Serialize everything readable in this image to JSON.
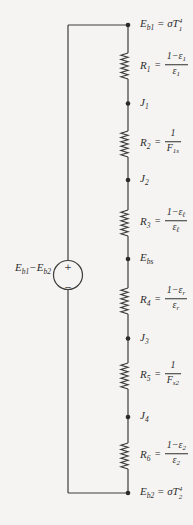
{
  "diagram": {
    "kind": "series radiation resistance network with shield",
    "colors": {
      "background": "#f5f4f2",
      "ink": "#3c3c3c",
      "text": "#2e2e2e"
    }
  },
  "source": {
    "plus": "+",
    "minus": "−",
    "label": {
      "m1": "E",
      "s1": "b1",
      "m2": "−E",
      "s2": "b2"
    }
  },
  "nodes": [
    {
      "id": "eb1",
      "main": "E",
      "sub": "b1",
      "eq": " = σT",
      "sup": "4",
      "sub2": "1"
    },
    {
      "id": "j1",
      "main": "J",
      "sub": "1"
    },
    {
      "id": "j2",
      "main": "J",
      "sub": "2"
    },
    {
      "id": "ebs",
      "main": "E",
      "sub": "bs"
    },
    {
      "id": "j3",
      "main": "J",
      "sub": "3"
    },
    {
      "id": "j4",
      "main": "J",
      "sub": "4"
    },
    {
      "id": "eb2",
      "main": "E",
      "sub": "b2",
      "eq": " = σT",
      "sup": "4",
      "sub2": "2"
    }
  ],
  "resistors": [
    {
      "id": "r1",
      "name": "R",
      "sub": "1",
      "eq": "=",
      "num": "1−ε",
      "num_sub": "1",
      "den": "ε",
      "den_sub": "1"
    },
    {
      "id": "r2",
      "name": "R",
      "sub": "2",
      "eq": "=",
      "num": "1",
      "num_sub": "",
      "den": "F",
      "den_sub": "1s"
    },
    {
      "id": "r3",
      "name": "R",
      "sub": "3",
      "eq": "=",
      "num": "1−ε",
      "num_sub": "ℓ",
      "den": "ε",
      "den_sub": "ℓ"
    },
    {
      "id": "r4",
      "name": "R",
      "sub": "4",
      "eq": "=",
      "num": "1−ε",
      "num_sub": "r",
      "den": "ε",
      "den_sub": "r"
    },
    {
      "id": "r5",
      "name": "R",
      "sub": "5",
      "eq": "=",
      "num": "1",
      "num_sub": "",
      "den": "F",
      "den_sub": "s2"
    },
    {
      "id": "r6",
      "name": "R",
      "sub": "6",
      "eq": "=",
      "num": "1−ε",
      "num_sub": "2",
      "den": "ε",
      "den_sub": "2"
    }
  ]
}
